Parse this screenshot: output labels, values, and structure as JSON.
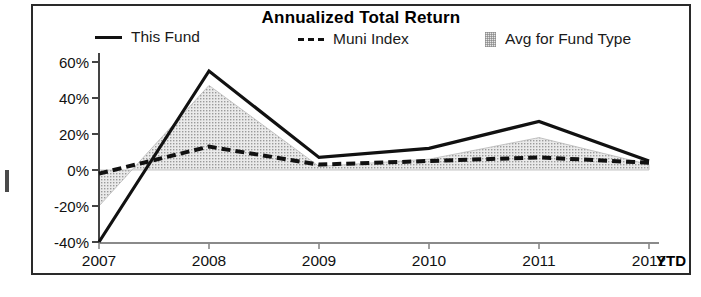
{
  "chart_data": {
    "type": "line",
    "title": "Annualized Total Return",
    "xlabel": "",
    "ylabel": "",
    "x": [
      "2007",
      "2008",
      "2009",
      "2010",
      "2011",
      "2012"
    ],
    "x_note": "YTD",
    "ylim": [
      -40,
      60
    ],
    "ytick_labels": [
      "60%",
      "40%",
      "20%",
      "0%",
      "-20%",
      "-40%"
    ],
    "ytick_values": [
      60,
      40,
      20,
      0,
      -20,
      -40
    ],
    "grid": false,
    "legend_position": "top",
    "series": [
      {
        "name": "This Fund",
        "style": "solid",
        "color": "#111111",
        "values": [
          -40,
          55,
          7,
          12,
          27,
          5
        ]
      },
      {
        "name": "Muni Index",
        "style": "dashed",
        "color": "#111111",
        "values": [
          -2,
          13,
          3,
          5,
          7,
          4
        ]
      },
      {
        "name": "Avg for Fund Type",
        "style": "area",
        "color": "#e6e6e6",
        "values": [
          -20,
          47,
          2,
          6,
          18,
          3
        ]
      }
    ]
  },
  "legend": {
    "this_fund": "This Fund",
    "muni_index": "Muni Index",
    "avg_for_fund_type": "Avg for Fund Type"
  },
  "axis": {
    "ytd": "YTD"
  }
}
